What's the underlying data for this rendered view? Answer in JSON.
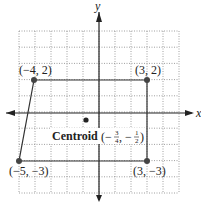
{
  "axes": {
    "x_label": "x",
    "y_label": "y",
    "range": [
      -5,
      5
    ]
  },
  "points": [
    {
      "label": "(−4, 2)",
      "x": -4,
      "y": 2
    },
    {
      "label": "(3, 2)",
      "x": 3,
      "y": 2
    },
    {
      "label": "(3, −3)",
      "x": 3,
      "y": -3
    },
    {
      "label": "(−5, −3)",
      "x": -5,
      "y": -3
    }
  ],
  "centroid": {
    "word": "Centroid",
    "open": "(−",
    "x_num": "3",
    "x_den": "4",
    "sep": ", −",
    "y_num": "1",
    "y_den": "2",
    "close": ")",
    "x": -0.75,
    "y": -0.5
  },
  "colors": {
    "line": "#333333",
    "grid": "#888888",
    "point": "#444444"
  }
}
